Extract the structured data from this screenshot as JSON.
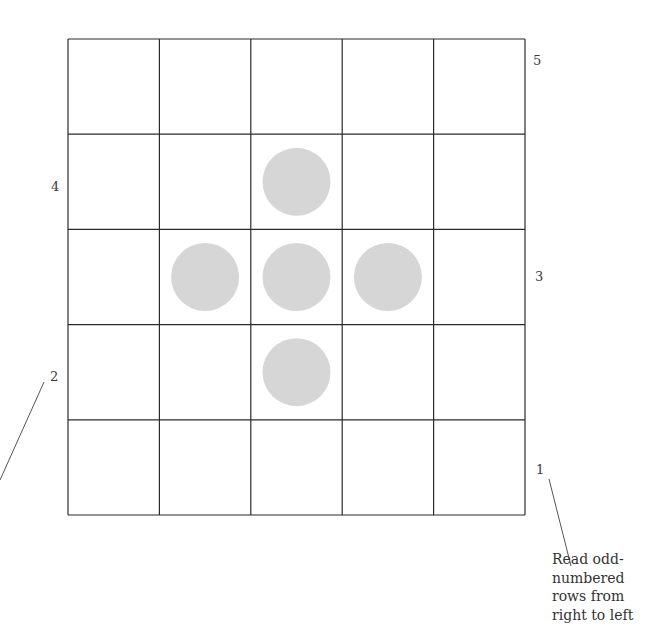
{
  "grid": {
    "rows": 5,
    "cols": 5,
    "left": 68,
    "top": 39,
    "right": 525,
    "bottom": 515,
    "line_color": "#2a2a2a"
  },
  "dots": {
    "color": "#d6d6d6",
    "radius": 34,
    "cells": [
      {
        "row": 2,
        "col": 3
      },
      {
        "row": 3,
        "col": 2
      },
      {
        "row": 3,
        "col": 3
      },
      {
        "row": 3,
        "col": 4
      },
      {
        "row": 4,
        "col": 3
      }
    ]
  },
  "row_labels": [
    {
      "text": "5",
      "side": "right",
      "x": 533,
      "y": 54
    },
    {
      "text": "4",
      "side": "left",
      "x": 51,
      "y": 180
    },
    {
      "text": "3",
      "side": "right",
      "x": 535,
      "y": 270
    },
    {
      "text": "2",
      "side": "left",
      "x": 50,
      "y": 370
    },
    {
      "text": "1",
      "side": "right",
      "x": 536,
      "y": 463
    }
  ],
  "leader_lines": [
    {
      "x1": 44,
      "y1": 382,
      "x2": 0,
      "y2": 480
    },
    {
      "x1": 549,
      "y1": 479,
      "x2": 571,
      "y2": 566
    }
  ],
  "note": {
    "text": "Read odd-\nnumbered\nrows from\nright to left"
  }
}
